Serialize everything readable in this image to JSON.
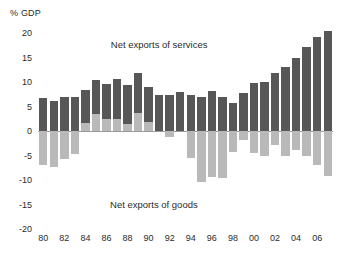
{
  "chart_data": {
    "type": "bar",
    "title": "",
    "subtitle": "",
    "xlabel": "",
    "ylabel": "% GDP",
    "ylim": [
      -20,
      20
    ],
    "ytick_labels": [
      "20",
      "15",
      "10",
      "5",
      "0",
      "-5",
      "-10",
      "-15",
      "-20"
    ],
    "ytick_values": [
      20,
      15,
      10,
      5,
      0,
      -5,
      -10,
      -15,
      -20
    ],
    "grid": false,
    "legend_position": "in-plot-annotation",
    "stacked": false,
    "bar_style": "overlaid positive/negative series sharing the zero baseline",
    "x": [
      1980,
      1981,
      1982,
      1983,
      1984,
      1985,
      1986,
      1987,
      1988,
      1989,
      1990,
      1991,
      1992,
      1993,
      1994,
      1995,
      1996,
      1997,
      1998,
      1999,
      2000,
      2001,
      2002,
      2003,
      2004,
      2005,
      2006,
      2007
    ],
    "xtick_labels": [
      "80",
      "82",
      "84",
      "86",
      "88",
      "90",
      "92",
      "94",
      "96",
      "98",
      "00",
      "02",
      "04",
      "06"
    ],
    "xtick_positions": [
      1980,
      1982,
      1984,
      1986,
      1988,
      1990,
      1992,
      1994,
      1996,
      1998,
      2000,
      2002,
      2004,
      2006
    ],
    "annotations": [
      {
        "text": "Net exports of services",
        "x": 1991,
        "y": 17.5
      },
      {
        "text": "Net exports of goods",
        "x": 1990.5,
        "y": -15.0
      }
    ],
    "series": [
      {
        "name": "Net exports of services",
        "color": "#575757",
        "values": [
          6.7,
          6.1,
          7.0,
          7.0,
          8.3,
          10.4,
          9.6,
          10.7,
          9.4,
          11.9,
          9.0,
          7.4,
          7.3,
          7.9,
          7.3,
          7.0,
          8.1,
          7.0,
          5.7,
          7.7,
          9.7,
          10.1,
          11.8,
          13.1,
          14.9,
          17.1,
          19.2,
          20.5
        ]
      },
      {
        "name": "Net exports of goods",
        "color": "#b9b9b9",
        "values": [
          -6.9,
          -7.3,
          -5.8,
          -4.6,
          1.6,
          3.5,
          2.4,
          2.4,
          1.4,
          3.6,
          1.9,
          0.0,
          -1.3,
          0.0,
          -5.5,
          -10.5,
          -9.3,
          -9.5,
          -4.3,
          -1.8,
          -4.5,
          -5.0,
          -2.9,
          -5.0,
          -3.8,
          -5.2,
          -7.0,
          -9.1
        ]
      }
    ]
  },
  "colors": {
    "services": "#575757",
    "goods": "#b9b9b9",
    "axis": "#9a9a9a",
    "text": "#2b2b2b",
    "background": "#ffffff"
  }
}
